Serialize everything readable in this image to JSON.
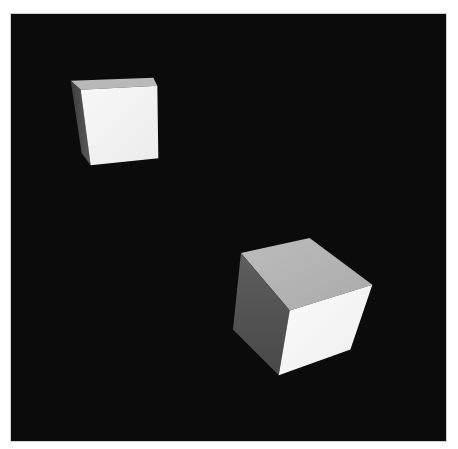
{
  "scene": {
    "description": "Two white-shaded cubes rendered on a black background",
    "background_color": "#0b0b0b",
    "objects": [
      {
        "name": "small-cube",
        "faces": {
          "top": "#b9b9b9",
          "left": "#4a4a4a",
          "front": "#f4f4f4"
        }
      },
      {
        "name": "large-cube",
        "faces": {
          "top": "#b5b5b5",
          "left": "#575757",
          "front": "#f6f6f6"
        }
      }
    ]
  }
}
